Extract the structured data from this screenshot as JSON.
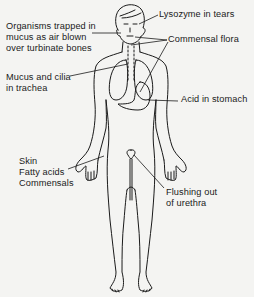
{
  "diagram": {
    "colors": {
      "ink": "#1a1a1a",
      "background": "#f4f4f2"
    },
    "labels": {
      "organisms": {
        "lines": [
          "Organisms trapped in",
          "mucus as air blown",
          "over turbinate bones"
        ]
      },
      "lysozyme": {
        "lines": [
          "Lysozyme in tears"
        ]
      },
      "commensal_flora": {
        "lines": [
          "Commensal flora"
        ]
      },
      "mucus_cilia": {
        "lines": [
          "Mucus and cilia",
          "in trachea"
        ]
      },
      "acid": {
        "lines": [
          "Acid in stomach"
        ]
      },
      "skin": {
        "lines": [
          "Skin",
          "Fatty acids",
          "Commensals"
        ]
      },
      "flushing": {
        "lines": [
          "Flushing out",
          "of urethra"
        ]
      }
    }
  }
}
